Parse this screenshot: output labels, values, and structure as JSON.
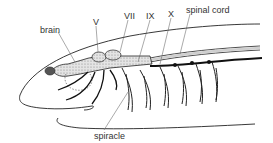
{
  "figure": {
    "labels": {
      "brain": "brain",
      "v": "V",
      "vii": "VII",
      "ix": "IX",
      "x": "X",
      "spinal_cord": "spinal cord",
      "spiracle": "spiracle"
    },
    "colors": {
      "line": "#222222",
      "stipple": "#bdbdbd",
      "label": "#333333",
      "background": "#ffffff"
    }
  }
}
